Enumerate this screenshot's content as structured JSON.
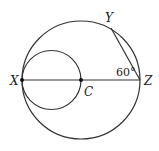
{
  "diagram": {
    "points": {
      "X": {
        "label": "X",
        "x": 22,
        "y": 80
      },
      "C": {
        "label": "C",
        "x": 81,
        "y": 80
      },
      "Z": {
        "label": "Z",
        "x": 140,
        "y": 80
      },
      "Y": {
        "label": "Y",
        "x": 111,
        "y": 28
      }
    },
    "big_circle": {
      "center": "C",
      "radius": 59
    },
    "small_circle": {
      "cx": 51.5,
      "cy": 80,
      "radius": 29.5
    },
    "segments": [
      "XZ",
      "YZ"
    ],
    "angle": {
      "vertex": "Z",
      "label": "60°"
    },
    "stroke_color": "#333333"
  }
}
